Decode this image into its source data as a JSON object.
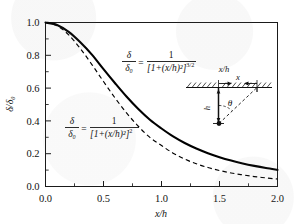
{
  "chart_data": {
    "type": "line",
    "title": "",
    "xlabel": "x/h",
    "ylabel": "δ/δ₀",
    "xlim": [
      0.0,
      2.0
    ],
    "ylim": [
      0.0,
      1.0
    ],
    "grid": false,
    "legend": "annotations-inline",
    "xticks": [
      "0.0",
      "0.5",
      "1.0",
      "1.5",
      "2.0"
    ],
    "xtick_values": [
      0.0,
      0.5,
      1.0,
      1.5,
      2.0
    ],
    "yticks": [
      "0.0",
      "0.2",
      "0.4",
      "0.6",
      "0.8",
      "1.0"
    ],
    "ytick_values": [
      0.0,
      0.2,
      0.4,
      0.6,
      0.8,
      1.0
    ],
    "x": [
      0.0,
      0.1,
      0.2,
      0.3,
      0.4,
      0.5,
      0.6,
      0.7,
      0.8,
      0.9,
      1.0,
      1.1,
      1.2,
      1.3,
      1.4,
      1.5,
      1.6,
      1.7,
      1.8,
      1.9,
      2.0
    ],
    "series": [
      {
        "name": "three-halves-power",
        "style": "solid",
        "color": "#000000",
        "values": [
          1.0,
          0.9852,
          0.943,
          0.8797,
          0.8044,
          0.7155,
          0.6295,
          0.547,
          0.4724,
          0.407,
          0.3536,
          0.3053,
          0.2652,
          0.2315,
          0.2031,
          0.1789,
          0.1584,
          0.1408,
          0.1257,
          0.1126,
          0.1013
        ]
      },
      {
        "name": "square-power",
        "style": "dashed",
        "color": "#000000",
        "values": [
          1.0,
          0.9803,
          0.9246,
          0.8417,
          0.7435,
          0.64,
          0.5395,
          0.4477,
          0.3673,
          0.2994,
          0.25,
          0.2033,
          0.167,
          0.1388,
          0.1156,
          0.0975,
          0.0826,
          0.0706,
          0.0606,
          0.0524,
          0.0455
        ]
      }
    ],
    "annotations": [
      {
        "name": "equation-three-halves",
        "lhs_num": "δ",
        "lhs_den": "δ₀",
        "eq": "=",
        "rhs_num": "1",
        "rhs_den_base": "[1+(x/h)²]",
        "rhs_den_exp": "3/2",
        "at_x": 0.72,
        "at_y": 0.68
      },
      {
        "name": "equation-square",
        "lhs_num": "δ",
        "lhs_den": "δ₀",
        "eq": "=",
        "rhs_num": "1",
        "rhs_den_base": "[1+(x/h)²]",
        "rhs_den_exp": "2",
        "at_x": 0.33,
        "at_y": 0.33
      }
    ],
    "inset": {
      "name": "geometry-inset",
      "top_label": "x/h",
      "x_label": "x",
      "h_label": "h",
      "angle_label": "θ",
      "surface": "hatched-ground-line",
      "ray": "dashed-oblique-ray"
    }
  }
}
